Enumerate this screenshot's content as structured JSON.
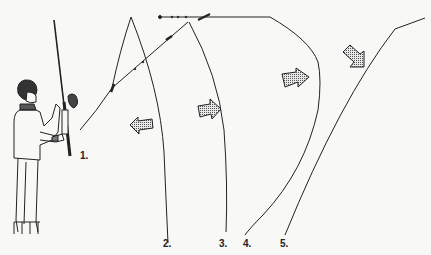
{
  "diagram": {
    "steps": [
      {
        "label": "1.",
        "x": 80,
        "y": 150
      },
      {
        "label": "2.",
        "x": 163,
        "y": 238
      },
      {
        "label": "3.",
        "x": 219,
        "y": 238
      },
      {
        "label": "4.",
        "x": 243,
        "y": 238
      },
      {
        "label": "5.",
        "x": 280,
        "y": 238
      }
    ],
    "arrows": [
      {
        "name": "arrow-left",
        "direction": "left"
      },
      {
        "name": "arrow-right-1",
        "direction": "right"
      },
      {
        "name": "arrow-right-2",
        "direction": "right"
      },
      {
        "name": "arrow-down-right",
        "direction": "down-right"
      }
    ],
    "colors": {
      "ink": "#222222",
      "paper": "#f8f8f6",
      "arrow_fill": "#9a9a9a"
    }
  }
}
